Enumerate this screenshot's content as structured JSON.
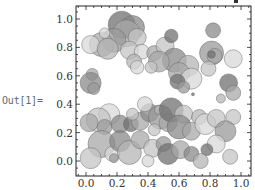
{
  "cell": {
    "out_label": "Out[1]="
  },
  "chart_data": {
    "type": "scatter",
    "title": "",
    "xlabel": "",
    "ylabel": "",
    "xlim": [
      -0.07,
      1.07
    ],
    "ylim": [
      -0.1,
      1.1
    ],
    "grid": false,
    "legend": null,
    "frame": true,
    "x_ticks": [
      "0.0",
      "0.2",
      "0.4",
      "0.6",
      "0.8",
      "1.0"
    ],
    "y_ticks": [
      "0.0",
      "0.2",
      "0.4",
      "0.6",
      "0.8",
      "1.0"
    ],
    "colors": [
      "#8a8a8a",
      "#a8a8a8",
      "#c4c4c4",
      "#d8d8d8",
      "#707070",
      "#9a9a9a",
      "#b6b6b6"
    ],
    "disks": [
      {
        "x": 0.23,
        "y": 0.96,
        "r": 0.09,
        "c": 4
      },
      {
        "x": 0.3,
        "y": 0.94,
        "r": 0.08,
        "c": 0
      },
      {
        "x": 0.26,
        "y": 0.9,
        "r": 0.09,
        "c": 1
      },
      {
        "x": 0.33,
        "y": 0.87,
        "r": 0.06,
        "c": 2
      },
      {
        "x": 0.18,
        "y": 0.85,
        "r": 0.08,
        "c": 5
      },
      {
        "x": 0.1,
        "y": 0.82,
        "r": 0.08,
        "c": 1
      },
      {
        "x": 0.03,
        "y": 0.82,
        "r": 0.06,
        "c": 3
      },
      {
        "x": 0.14,
        "y": 0.79,
        "r": 0.07,
        "c": 6
      },
      {
        "x": 0.28,
        "y": 0.78,
        "r": 0.06,
        "c": 2
      },
      {
        "x": 0.36,
        "y": 0.77,
        "r": 0.05,
        "c": 3
      },
      {
        "x": 0.31,
        "y": 0.7,
        "r": 0.05,
        "c": 6
      },
      {
        "x": 0.33,
        "y": 0.66,
        "r": 0.045,
        "c": 3
      },
      {
        "x": 0.44,
        "y": 0.76,
        "r": 0.05,
        "c": 1
      },
      {
        "x": 0.51,
        "y": 0.81,
        "r": 0.06,
        "c": 2
      },
      {
        "x": 0.55,
        "y": 0.88,
        "r": 0.045,
        "c": 4
      },
      {
        "x": 0.57,
        "y": 0.71,
        "r": 0.08,
        "c": 0
      },
      {
        "x": 0.47,
        "y": 0.7,
        "r": 0.07,
        "c": 1
      },
      {
        "x": 0.42,
        "y": 0.66,
        "r": 0.04,
        "c": 2
      },
      {
        "x": 0.66,
        "y": 0.67,
        "r": 0.07,
        "c": 6
      },
      {
        "x": 0.6,
        "y": 0.62,
        "r": 0.07,
        "c": 1
      },
      {
        "x": 0.68,
        "y": 0.58,
        "r": 0.07,
        "c": 3
      },
      {
        "x": 0.59,
        "y": 0.56,
        "r": 0.05,
        "c": 4
      },
      {
        "x": 0.63,
        "y": 0.52,
        "r": 0.04,
        "c": 5
      },
      {
        "x": 0.69,
        "y": 0.47,
        "r": 0.01,
        "c": 4
      },
      {
        "x": 0.82,
        "y": 0.92,
        "r": 0.05,
        "c": 0
      },
      {
        "x": 0.81,
        "y": 0.76,
        "r": 0.08,
        "c": 5
      },
      {
        "x": 0.83,
        "y": 0.74,
        "r": 0.05,
        "c": 1
      },
      {
        "x": 0.81,
        "y": 0.75,
        "r": 0.025,
        "c": 4
      },
      {
        "x": 0.79,
        "y": 0.65,
        "r": 0.05,
        "c": 2
      },
      {
        "x": 0.95,
        "y": 0.72,
        "r": 0.06,
        "c": 3
      },
      {
        "x": 0.92,
        "y": 0.55,
        "r": 0.06,
        "c": 4
      },
      {
        "x": 0.95,
        "y": 0.48,
        "r": 0.05,
        "c": 1
      },
      {
        "x": 0.95,
        "y": 0.31,
        "r": 0.05,
        "c": 2
      },
      {
        "x": 0.87,
        "y": 0.44,
        "r": 0.03,
        "c": 6
      },
      {
        "x": 0.04,
        "y": 0.61,
        "r": 0.04,
        "c": 1
      },
      {
        "x": 0.03,
        "y": 0.55,
        "r": 0.07,
        "c": 0
      },
      {
        "x": 0.05,
        "y": 0.51,
        "r": 0.04,
        "c": 5
      },
      {
        "x": 0.12,
        "y": 0.9,
        "r": 0.035,
        "c": 3
      },
      {
        "x": 0.15,
        "y": 0.33,
        "r": 0.07,
        "c": 3
      },
      {
        "x": 0.08,
        "y": 0.29,
        "r": 0.08,
        "c": 2
      },
      {
        "x": 0.02,
        "y": 0.27,
        "r": 0.06,
        "c": 1
      },
      {
        "x": 0.12,
        "y": 0.24,
        "r": 0.05,
        "c": 5
      },
      {
        "x": 0.22,
        "y": 0.26,
        "r": 0.06,
        "c": 0
      },
      {
        "x": 0.29,
        "y": 0.26,
        "r": 0.05,
        "c": 4
      },
      {
        "x": 0.35,
        "y": 0.28,
        "r": 0.06,
        "c": 1
      },
      {
        "x": 0.3,
        "y": 0.33,
        "r": 0.04,
        "c": 2
      },
      {
        "x": 0.41,
        "y": 0.34,
        "r": 0.06,
        "c": 0
      },
      {
        "x": 0.48,
        "y": 0.31,
        "r": 0.08,
        "c": 5
      },
      {
        "x": 0.53,
        "y": 0.27,
        "r": 0.06,
        "c": 1
      },
      {
        "x": 0.44,
        "y": 0.22,
        "r": 0.04,
        "c": 2
      },
      {
        "x": 0.47,
        "y": 0.36,
        "r": 0.03,
        "c": 6
      },
      {
        "x": 0.38,
        "y": 0.4,
        "r": 0.05,
        "c": 3
      },
      {
        "x": 0.55,
        "y": 0.36,
        "r": 0.08,
        "c": 4
      },
      {
        "x": 0.63,
        "y": 0.33,
        "r": 0.06,
        "c": 2
      },
      {
        "x": 0.6,
        "y": 0.24,
        "r": 0.08,
        "c": 0
      },
      {
        "x": 0.68,
        "y": 0.21,
        "r": 0.06,
        "c": 1
      },
      {
        "x": 0.73,
        "y": 0.31,
        "r": 0.05,
        "c": 6
      },
      {
        "x": 0.77,
        "y": 0.26,
        "r": 0.07,
        "c": 3
      },
      {
        "x": 0.84,
        "y": 0.3,
        "r": 0.06,
        "c": 2
      },
      {
        "x": 0.9,
        "y": 0.21,
        "r": 0.07,
        "c": 5
      },
      {
        "x": 0.84,
        "y": 0.12,
        "r": 0.06,
        "c": 3
      },
      {
        "x": 0.78,
        "y": 0.08,
        "r": 0.04,
        "c": 4
      },
      {
        "x": 0.1,
        "y": 0.12,
        "r": 0.09,
        "c": 1
      },
      {
        "x": 0.03,
        "y": 0.02,
        "r": 0.07,
        "c": 2
      },
      {
        "x": 0.17,
        "y": 0.05,
        "r": 0.05,
        "c": 3
      },
      {
        "x": 0.22,
        "y": 0.14,
        "r": 0.07,
        "c": 0
      },
      {
        "x": 0.28,
        "y": 0.06,
        "r": 0.08,
        "c": 6
      },
      {
        "x": 0.35,
        "y": 0.15,
        "r": 0.06,
        "c": 1
      },
      {
        "x": 0.43,
        "y": 0.09,
        "r": 0.06,
        "c": 2
      },
      {
        "x": 0.5,
        "y": 0.12,
        "r": 0.05,
        "c": 5
      },
      {
        "x": 0.53,
        "y": 0.05,
        "r": 0.07,
        "c": 4
      },
      {
        "x": 0.61,
        "y": 0.08,
        "r": 0.06,
        "c": 1
      },
      {
        "x": 0.68,
        "y": 0.05,
        "r": 0.05,
        "c": 0
      },
      {
        "x": 0.93,
        "y": 0.03,
        "r": 0.05,
        "c": 2
      },
      {
        "x": 0.18,
        "y": 0.02,
        "r": 0.03,
        "c": 5
      },
      {
        "x": 0.4,
        "y": 0.0,
        "r": 0.04,
        "c": 3
      },
      {
        "x": 0.74,
        "y": 0.0,
        "r": 0.05,
        "c": 6
      }
    ]
  }
}
